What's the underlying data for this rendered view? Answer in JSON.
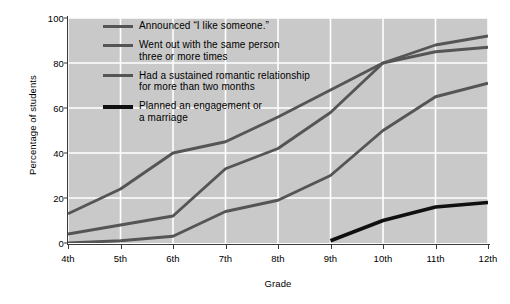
{
  "chart_data": {
    "type": "line",
    "title": "",
    "xlabel": "Grade",
    "ylabel": "Percentage of students",
    "categories": [
      "4th",
      "5th",
      "6th",
      "7th",
      "8th",
      "9th",
      "10th",
      "11th",
      "12th"
    ],
    "xlim": [
      0,
      8
    ],
    "ylim": [
      0,
      100
    ],
    "yticks": [
      0,
      20,
      40,
      60,
      80,
      100
    ],
    "grid": true,
    "legend_position": "upper-left-inside",
    "series": [
      {
        "name": "Announced \"I like someone.\"",
        "color": "#555555",
        "values": [
          13,
          24,
          40,
          45,
          56,
          68,
          80,
          88,
          92
        ]
      },
      {
        "name": "Went out with the same person three or more times",
        "color": "#555555",
        "values": [
          4,
          8,
          12,
          33,
          42,
          58,
          80,
          85,
          87
        ]
      },
      {
        "name": "Had a sustained romantic relationship for more than two months",
        "color": "#555555",
        "values": [
          0,
          1,
          3,
          14,
          19,
          30,
          50,
          65,
          71
        ]
      },
      {
        "name": "Planned an engagement or a marriage",
        "color": "#101010",
        "values": [
          null,
          null,
          null,
          null,
          null,
          1,
          10,
          16,
          18
        ]
      }
    ]
  },
  "axes": {
    "y_title": "Percentage of students",
    "x_title": "Grade",
    "y_tick_labels": [
      "0",
      "20",
      "40",
      "60",
      "80",
      "100"
    ],
    "x_tick_labels": [
      "4th",
      "5th",
      "6th",
      "7th",
      "8th",
      "9th",
      "10th",
      "11th",
      "12th"
    ]
  },
  "legend": {
    "items": [
      {
        "label": "Announced “I like someone.”",
        "style": "medium"
      },
      {
        "label": "Went out with the same person\nthree or more times",
        "style": "medium"
      },
      {
        "label": "Had a sustained romantic relationship\nfor more than two months",
        "style": "medium"
      },
      {
        "label": "Planned an engagement or\na marriage",
        "style": "thick"
      }
    ]
  },
  "colors": {
    "plot_background": "#c9c9c9",
    "gridline": "#ffffff",
    "axis": "#3a3a3a",
    "series_gray": "#555555",
    "series_black": "#101010",
    "page_background": "#ffffff"
  }
}
